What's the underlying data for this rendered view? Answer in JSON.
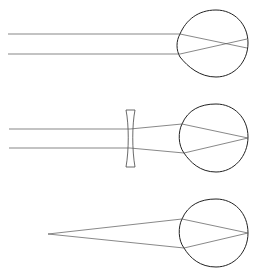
{
  "diagram": {
    "topic": "Myopia (nearsightedness) and its correction with a concave lens",
    "panels": [
      {
        "id": "myopic-eye",
        "description": "Parallel rays focus in front of the retina"
      },
      {
        "id": "corrected-eye",
        "description": "Concave lens diverges rays so they focus on the retina"
      },
      {
        "id": "near-object",
        "description": "Rays from a near point source focus on the retina"
      }
    ],
    "colors": {
      "lines": "#555555",
      "eye_outline": "#222222",
      "background": "#ffffff"
    }
  }
}
